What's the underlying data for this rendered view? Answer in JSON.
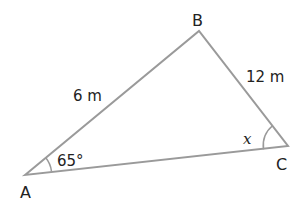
{
  "diagram": {
    "type": "triangle",
    "vertices": [
      {
        "name": "A",
        "label": "A",
        "x": 25,
        "y": 175
      },
      {
        "name": "B",
        "label": "B",
        "x": 199,
        "y": 31
      },
      {
        "name": "C",
        "label": "C",
        "x": 288,
        "y": 146
      }
    ],
    "sides": [
      {
        "from": "A",
        "to": "B",
        "label": "6 m"
      },
      {
        "from": "B",
        "to": "C",
        "label": "12 m"
      },
      {
        "from": "A",
        "to": "C",
        "label": ""
      }
    ],
    "angles": [
      {
        "vertex": "A",
        "label": "65°"
      },
      {
        "vertex": "C",
        "label": "x"
      }
    ],
    "colors": {
      "line": "#9a9a9a",
      "text": "#222222"
    }
  }
}
